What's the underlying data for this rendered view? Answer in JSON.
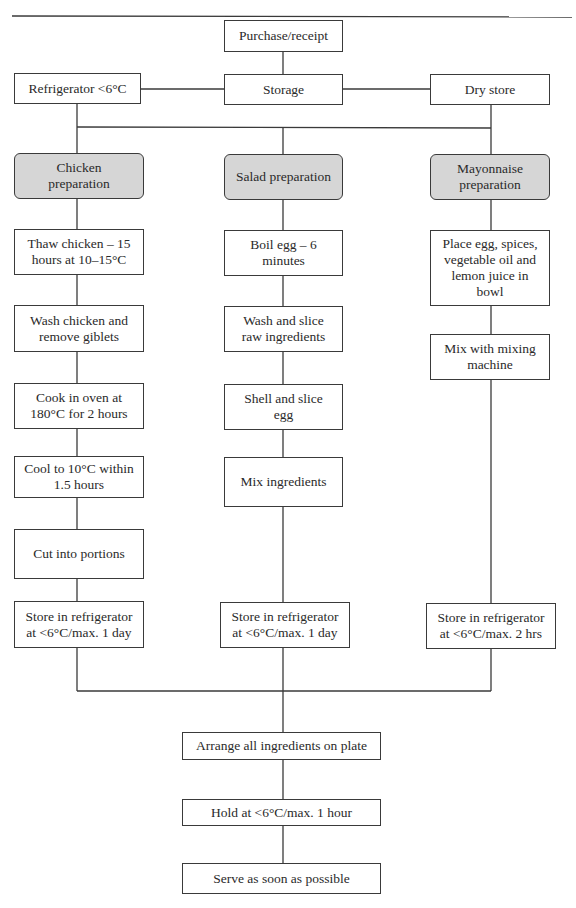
{
  "flowchart": {
    "top": {
      "purchase": "Purchase/receipt",
      "storage": "Storage",
      "refrigerator": "Refrigerator <6°C",
      "dry_store": "Dry store"
    },
    "columns": {
      "chicken": {
        "header": "Chicken\npreparation",
        "steps": [
          "Thaw chicken – 15\nhours at 10–15°C",
          "Wash chicken and\nremove giblets",
          "Cook in oven at\n180°C for 2 hours",
          "Cool to 10°C within\n1.5 hours",
          "Cut into portions",
          "Store in refrigerator\nat <6°C/max. 1 day"
        ]
      },
      "salad": {
        "header": "Salad preparation",
        "steps": [
          "Boil egg – 6\nminutes",
          "Wash and slice\nraw ingredients",
          "Shell and slice\negg",
          "Mix ingredients",
          "Store in refrigerator\nat <6°C/max. 1 day"
        ]
      },
      "mayonnaise": {
        "header": "Mayonnaise\npreparation",
        "steps": [
          "Place egg, spices,\nvegetable oil and\nlemon juice in\nbowl",
          "Mix with mixing\nmachine",
          "Store in refrigerator\nat <6°C/max. 2 hrs"
        ]
      }
    },
    "final": {
      "arrange": "Arrange all ingredients on plate",
      "hold": "Hold at <6°C/max. 1 hour",
      "serve": "Serve as soon as possible"
    },
    "colors": {
      "header_fill": "#d6d6d6",
      "line": "#3a3a3a"
    }
  }
}
